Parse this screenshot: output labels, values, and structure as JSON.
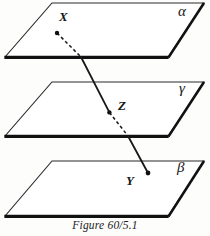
{
  "figure": {
    "caption": "Figure 60/5.1",
    "ink_color": "#161616",
    "background_color": "#fdfdfc"
  },
  "planes": [
    {
      "id": "alpha",
      "label": "α",
      "name": "plane-alpha",
      "corners": {
        "top_left": [
          52,
          3
        ],
        "top_right": [
          204,
          3
        ],
        "bottom_right": [
          168,
          57
        ],
        "bottom_left": [
          5,
          57
        ]
      },
      "label_pos": [
        178,
        4
      ]
    },
    {
      "id": "gamma",
      "label": "γ",
      "name": "plane-gamma",
      "corners": {
        "top_left": [
          52,
          82
        ],
        "top_right": [
          204,
          82
        ],
        "bottom_right": [
          168,
          136
        ],
        "bottom_left": [
          5,
          136
        ]
      },
      "label_pos": [
        179,
        81
      ]
    },
    {
      "id": "beta",
      "label": "β",
      "name": "plane-beta",
      "corners": {
        "top_left": [
          52,
          161
        ],
        "top_right": [
          204,
          161
        ],
        "bottom_right": [
          168,
          216
        ],
        "bottom_left": [
          5,
          216
        ]
      },
      "label_pos": [
        177,
        160
      ]
    }
  ],
  "points": [
    {
      "id": "X",
      "label": "X",
      "on_plane": "alpha",
      "dot": [
        57,
        33
      ],
      "label_pos": [
        59,
        10
      ]
    },
    {
      "id": "Z",
      "label": "Z",
      "on_plane": "gamma",
      "dot": [
        109,
        112
      ],
      "label_pos": [
        118,
        99
      ]
    },
    {
      "id": "Y",
      "label": "Y",
      "on_plane": "beta",
      "dot": [
        148,
        173
      ],
      "label_pos": [
        126,
        174
      ]
    }
  ],
  "transversal": {
    "name": "line-XYZ",
    "from": "X",
    "through": "Z",
    "to": "Y",
    "segments": [
      {
        "style": "dashed",
        "from": [
          57,
          33
        ],
        "to": [
          81,
          57
        ]
      },
      {
        "style": "solid",
        "from": [
          81,
          57
        ],
        "to": [
          109,
          112
        ]
      },
      {
        "style": "dashed",
        "from": [
          109,
          112
        ],
        "to": [
          128,
          136
        ]
      },
      {
        "style": "solid",
        "from": [
          128,
          136
        ],
        "to": [
          148,
          173
        ]
      }
    ]
  }
}
